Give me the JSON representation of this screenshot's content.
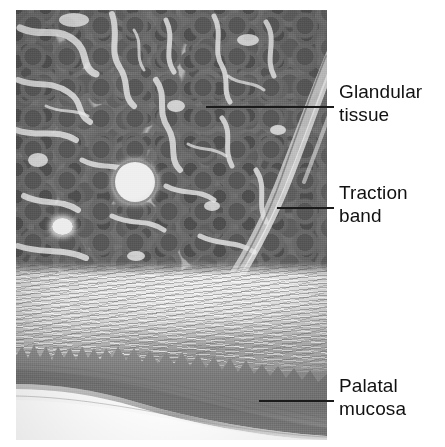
{
  "figure": {
    "kind": "histology-micrograph",
    "background_color": "#ffffff",
    "plate": {
      "x": 16,
      "y": 10,
      "width": 311,
      "height": 430,
      "description": "Hematoxylin-eosin stained vertical section of hard palate showing glandular tissue, traction band and palatal mucosa"
    },
    "annotations": [
      {
        "id": "glandular-tissue",
        "label": "Glandular\ntissue",
        "line1": "Glandular",
        "line2": "tissue",
        "leader": {
          "x": 206,
          "y": 106,
          "length": 128
        },
        "text_x": 339,
        "text_y": 80,
        "color": "#111111"
      },
      {
        "id": "traction-band",
        "label": "Traction\nband",
        "line1": "Traction",
        "line2": "band",
        "leader": {
          "x": 277,
          "y": 207,
          "length": 57
        },
        "text_x": 339,
        "text_y": 181,
        "color": "#111111"
      },
      {
        "id": "palatal-mucosa",
        "label": "Palatal\nmucosa",
        "line1": "Palatal",
        "line2": "mucosa",
        "leader": {
          "x": 259,
          "y": 400,
          "length": 75
        },
        "text_x": 339,
        "text_y": 374,
        "color": "#111111"
      }
    ],
    "regions": [
      {
        "id": "glandular-region",
        "name": "Glandular tissue",
        "y_from": 10,
        "y_to": 298,
        "tone": "#707070"
      },
      {
        "id": "traction-band-region",
        "name": "Traction band",
        "y_from": 46,
        "y_to": 298,
        "tone": "#c6c6c6"
      },
      {
        "id": "fibrous-region",
        "name": "Submucosal fibrous connective tissue",
        "y_from": 262,
        "y_to": 372,
        "tone": "#b6b6b6"
      },
      {
        "id": "mucosa-region",
        "name": "Palatal mucosa epithelium",
        "y_from": 340,
        "y_to": 440,
        "tone": "#808080"
      }
    ],
    "palette": {
      "acini_dark": "#5a5a5a",
      "acini_mid": "#707070",
      "septa_light": "#e4e4e4",
      "fibrous": "#b6b6b6",
      "epithelium": "#808080",
      "lumen": "#efefef",
      "leader_line": "#1a1a1a",
      "text": "#111111",
      "background": "#ffffff"
    }
  }
}
